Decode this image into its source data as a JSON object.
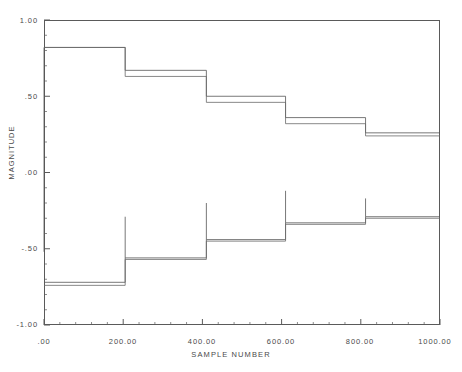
{
  "chart_data": {
    "type": "line",
    "title": "",
    "xlabel": "SAMPLE NUMBER",
    "ylabel": "MAGNITUDE",
    "xlim": [
      0,
      1000
    ],
    "ylim": [
      -1.0,
      1.0
    ],
    "grid": false,
    "legend": "none",
    "xticks": [
      0,
      200,
      400,
      600,
      800,
      1000
    ],
    "xtick_labels": [
      ".00",
      "200.00",
      "400.00",
      "600.00",
      "800.00",
      "1000.00"
    ],
    "yticks": [
      -1.0,
      -0.5,
      0.0,
      0.5,
      1.0
    ],
    "ytick_labels": [
      "-1.00",
      "-.50",
      ".00",
      ".50",
      "1.00"
    ],
    "x_minor_tick_count": 4,
    "y_minor_tick_count": 4,
    "step_boundaries": [
      0,
      205,
      410,
      610,
      812,
      1000
    ],
    "series": [
      {
        "name": "upper-trace-a",
        "style": "step",
        "color": "#555555",
        "x": [
          0,
          205,
          410,
          610,
          812,
          1000
        ],
        "values": [
          0.82,
          0.67,
          0.5,
          0.36,
          0.26,
          0.26
        ]
      },
      {
        "name": "upper-trace-b",
        "style": "step",
        "color": "#6a6a6a",
        "x": [
          0,
          205,
          410,
          610,
          812,
          1000
        ],
        "values": [
          0.82,
          0.63,
          0.46,
          0.32,
          0.24,
          0.24
        ]
      },
      {
        "name": "lower-trace-a",
        "style": "step",
        "color": "#555555",
        "x": [
          0,
          205,
          410,
          610,
          812,
          1000
        ],
        "values": [
          -0.72,
          -0.56,
          -0.44,
          -0.33,
          -0.29,
          -0.29
        ]
      },
      {
        "name": "lower-trace-b",
        "style": "step",
        "color": "#6a6a6a",
        "x": [
          0,
          205,
          410,
          610,
          812,
          1000
        ],
        "values": [
          -0.74,
          -0.57,
          -0.45,
          -0.34,
          -0.3,
          -0.3
        ]
      }
    ],
    "overshoot_spikes": [
      {
        "x": 205,
        "from": -0.56,
        "to": -0.29
      },
      {
        "x": 410,
        "from": -0.44,
        "to": -0.2
      },
      {
        "x": 610,
        "from": -0.33,
        "to": -0.12
      },
      {
        "x": 812,
        "from": -0.29,
        "to": -0.17
      }
    ],
    "initial_transient": {
      "x": 0,
      "from": 0.82,
      "to": -0.52
    }
  },
  "axis": {
    "y_title": "MAGNITUDE",
    "x_title": "SAMPLE NUMBER",
    "y_labels": [
      "1.00",
      ".50",
      ".00",
      "-.50",
      "-1.00"
    ],
    "x_labels": [
      ".00",
      "200.00",
      "400.00",
      "600.00",
      "800.00",
      "1000.00"
    ]
  },
  "colors": {
    "frame": "#5a5a5a",
    "trace_primary": "#555555",
    "trace_secondary": "#6a6a6a",
    "text": "#4a4a4a",
    "background": "#ffffff"
  }
}
